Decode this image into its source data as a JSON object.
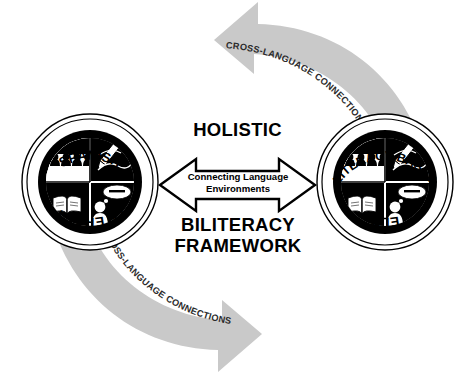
{
  "diagram": {
    "background_color": "#ffffff",
    "cycle_arrow_color": "#c9c9c9",
    "badge_color": "#000000"
  },
  "cycle": {
    "top_arrow": {
      "label": "CROSS-LANGUAGE CONNECTIONS",
      "direction": "counter-clockwise-left"
    },
    "bottom_arrow": {
      "label": "CROSS-LANGUAGE CONNECTIONS",
      "direction": "clockwise-right"
    }
  },
  "center": {
    "heading_top": "HOLISTIC",
    "heading_bottom_line1": "BILITERACY",
    "heading_bottom_line2": "FRAMEWORK",
    "arrow_caption_line1": "Connecting Language",
    "arrow_caption_line2": "Environments"
  },
  "badges": [
    {
      "id": "spanish-literacy",
      "top_label": "SPANISH",
      "bottom_label": "LITERACY",
      "quadrants": [
        {
          "position": "top-left",
          "icon": "audience-people-icon",
          "meaning": "Listening"
        },
        {
          "position": "top-right",
          "icon": "pencil-writing-icon",
          "meaning": "Writing"
        },
        {
          "position": "bottom-left",
          "icon": "open-book-icon",
          "meaning": "Reading"
        },
        {
          "position": "bottom-right",
          "icon": "person-speech-bubble-icon",
          "meaning": "Speaking"
        }
      ]
    },
    {
      "id": "literacy-based-eld",
      "top_label": "LITERACY-BASED",
      "bottom_label": "ELD",
      "quadrants": [
        {
          "position": "top-left",
          "icon": "audience-people-icon",
          "meaning": "Listening"
        },
        {
          "position": "top-right",
          "icon": "pencil-writing-icon",
          "meaning": "Writing"
        },
        {
          "position": "bottom-left",
          "icon": "open-book-icon",
          "meaning": "Reading"
        },
        {
          "position": "bottom-right",
          "icon": "person-speech-bubble-icon",
          "meaning": "Speaking"
        }
      ]
    }
  ]
}
